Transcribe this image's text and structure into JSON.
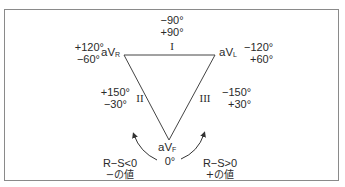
{
  "diagram": {
    "title": "",
    "leads": {
      "aVR": {
        "base": "aV",
        "sub": "R"
      },
      "aVL": {
        "base": "aV",
        "sub": "L"
      },
      "aVF": {
        "base": "aV",
        "sub": "F"
      }
    },
    "sides": {
      "I": {
        "roman": "I",
        "angles": [
          "−90°",
          "+90°"
        ]
      },
      "II": {
        "roman": "II",
        "angles": [
          "+150°",
          "−30°"
        ]
      },
      "III": {
        "roman": "III",
        "angles": [
          "−150°",
          "+30°"
        ]
      }
    },
    "vertex_angles": {
      "aVR": [
        "+120°",
        "−60°"
      ],
      "aVL": [
        "−120°",
        "+60°"
      ],
      "aVF": "0°"
    },
    "arrows": {
      "left": {
        "condition": "R−S<0",
        "meaning": "−の値"
      },
      "right": {
        "condition": "R−S>0",
        "meaning": "+の値"
      }
    },
    "colors": {
      "line": "#333333",
      "border": "#8a8a8a",
      "text": "#2a2a2a"
    }
  }
}
